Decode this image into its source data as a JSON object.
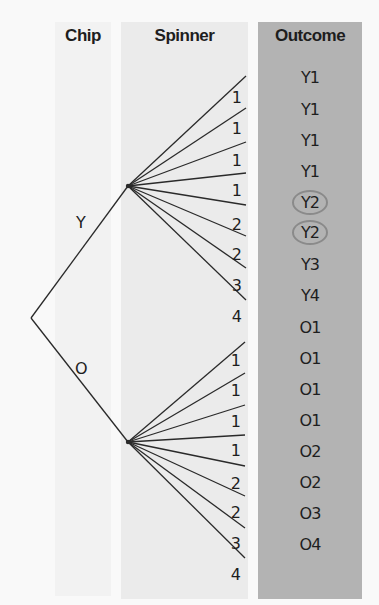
{
  "columns": {
    "chip": "Chip",
    "spinner": "Spinner",
    "outcome": "Outcome"
  },
  "chip_branches": [
    {
      "label": "Y"
    },
    {
      "label": "O"
    }
  ],
  "spinner_labels": {
    "Y": [
      "1",
      "1",
      "1",
      "1",
      "2",
      "2",
      "3",
      "4"
    ],
    "O": [
      "1",
      "1",
      "1",
      "1",
      "2",
      "2",
      "3",
      "4"
    ]
  },
  "outcomes": [
    {
      "label": "Y1",
      "circled": false
    },
    {
      "label": "Y1",
      "circled": false
    },
    {
      "label": "Y1",
      "circled": false
    },
    {
      "label": "Y1",
      "circled": false
    },
    {
      "label": "Y2",
      "circled": true
    },
    {
      "label": "Y2",
      "circled": true
    },
    {
      "label": "Y3",
      "circled": false
    },
    {
      "label": "Y4",
      "circled": false
    },
    {
      "label": "O1",
      "circled": false
    },
    {
      "label": "O1",
      "circled": false
    },
    {
      "label": "O1",
      "circled": false
    },
    {
      "label": "O1",
      "circled": false
    },
    {
      "label": "O2",
      "circled": false
    },
    {
      "label": "O2",
      "circled": false
    },
    {
      "label": "O3",
      "circled": false
    },
    {
      "label": "O4",
      "circled": false
    }
  ],
  "colors": {
    "chip_bg": "#f2f2f2",
    "spinner_bg": "#ebebeb",
    "outcome_bg": "#b3b3b3",
    "circle": "#8a8a8a",
    "line": "#2a2a2a"
  }
}
